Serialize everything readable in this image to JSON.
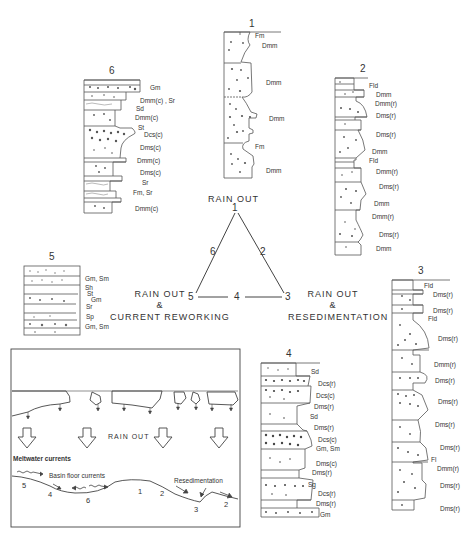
{
  "figure": {
    "triangle": {
      "vertices": [
        {
          "id": "1",
          "caption": "RAIN OUT"
        },
        {
          "id": "3",
          "caption_lines": [
            "RAIN OUT",
            "&",
            "RESEDIMENTATION"
          ]
        },
        {
          "id": "5",
          "caption_lines": [
            "RAIN OUT",
            "&",
            "CURRENT REWORKING"
          ]
        }
      ],
      "edge_labels": {
        "left": "6",
        "right": "2",
        "bottom": "4"
      }
    },
    "logs": [
      {
        "id": "1",
        "labels": [
          "Fm",
          "Dmm",
          "Dmm",
          "Dmm",
          "Fm",
          "Dmm"
        ]
      },
      {
        "id": "2",
        "labels": [
          "Fld",
          "Dmm",
          "Dmm(r)",
          "Dms(r)",
          "Dms(r)",
          "Dmm",
          "Fld",
          "Dmm(r)",
          "Dms(r)",
          "Dmm",
          "Dmm(r)",
          "Dms(r)",
          "Dmm"
        ]
      },
      {
        "id": "3",
        "labels": [
          "Fld",
          "Dms(r)",
          "Dms(r)",
          "Fld",
          "Dms(r)",
          "Dmm(r)",
          "Dms(r)",
          "Dms(r)",
          "Dms(r)",
          "Dms(r)",
          "Fl",
          "Dmm(r)",
          "Dms(r)",
          "Dms(r)"
        ]
      },
      {
        "id": "4",
        "labels": [
          "Sd",
          "Dcs(r)",
          "Dcs(c)",
          "Dms(r)",
          "Sd",
          "Dms(r)",
          "Dcs(c)",
          "Gm, Sm",
          "Dms(c)",
          "Dms(r)",
          "Sg",
          "Dcs(r)",
          "Dms(r)",
          "Gm"
        ]
      },
      {
        "id": "5",
        "labels": [
          "Gm, Sm",
          "Sh",
          "St",
          "Gm",
          "Sr",
          "Sp",
          "Gm, Sm"
        ]
      },
      {
        "id": "6",
        "labels": [
          "Gm",
          "Dmm(c) , Sr",
          "Sd",
          "Dmm(c)",
          "St",
          "Dcs(c)",
          "Dms(c)",
          "Dmm(c)",
          "Dms(c)",
          "Sr",
          "Fm, Sr",
          "Dmm(c)"
        ]
      }
    ],
    "inset": {
      "rain_out": "RAIN OUT",
      "meltwater": "Meltwater currents",
      "basin_floor": "Basin floor currents",
      "resedimentation": "Resedimentation",
      "floor_numbers": [
        "5",
        "4",
        "6",
        "1",
        "2",
        "3",
        "2"
      ]
    }
  }
}
